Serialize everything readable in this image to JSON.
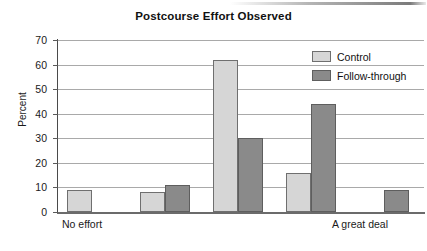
{
  "chart_data": {
    "type": "bar",
    "title": "Postcourse Effort Observed",
    "xlabel": "",
    "ylabel": "Percent",
    "ylim": [
      0,
      70
    ],
    "ytick_step": 10,
    "yticks": [
      0,
      10,
      20,
      30,
      40,
      50,
      60,
      70
    ],
    "grid": true,
    "legend_position": "top-right",
    "categories": [
      "No effort",
      "",
      "",
      "",
      "A great deal"
    ],
    "category_axis_labels": {
      "left": "No effort",
      "right": "A great deal"
    },
    "series": [
      {
        "name": "Control",
        "color": "#d6d6d6",
        "values": [
          9,
          8,
          62,
          16,
          0
        ]
      },
      {
        "name": "Follow-through",
        "color": "#8a8a8a",
        "values": [
          0,
          11,
          30,
          44,
          9
        ]
      }
    ]
  },
  "legend": {
    "items": [
      {
        "label": "Control",
        "swatch": "light-gray-swatch"
      },
      {
        "label": "Follow-through",
        "swatch": "dark-gray-swatch"
      }
    ]
  }
}
